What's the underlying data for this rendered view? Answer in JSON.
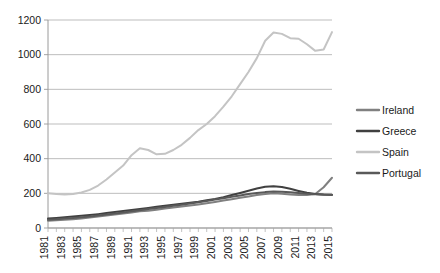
{
  "chart_data": {
    "type": "line",
    "title": "",
    "subtitle": "",
    "xlabel": "",
    "ylabel": "",
    "ylim": [
      0,
      1200
    ],
    "xlim": [
      1981,
      2015
    ],
    "yticks": [
      0,
      200,
      400,
      600,
      800,
      1000,
      1200
    ],
    "grid": true,
    "legend_position": "right",
    "x": [
      1981,
      1982,
      1983,
      1984,
      1985,
      1986,
      1987,
      1988,
      1989,
      1990,
      1991,
      1992,
      1993,
      1994,
      1995,
      1996,
      1997,
      1998,
      1999,
      2000,
      2001,
      2002,
      2003,
      2004,
      2005,
      2006,
      2007,
      2008,
      2009,
      2010,
      2011,
      2012,
      2013,
      2014,
      2015
    ],
    "xtick_labels": [
      "1981",
      "1983",
      "1985",
      "1987",
      "1989",
      "1991",
      "1993",
      "1995",
      "1997",
      "1999",
      "2001",
      "2003",
      "2005",
      "2007",
      "2009",
      "2011",
      "2013",
      "2015"
    ],
    "series": [
      {
        "name": "Ireland",
        "color": "#808080",
        "width": 2.0,
        "values": [
          42,
          44,
          47,
          50,
          55,
          60,
          66,
          72,
          78,
          84,
          90,
          96,
          100,
          105,
          112,
          118,
          124,
          130,
          136,
          143,
          150,
          158,
          166,
          174,
          182,
          190,
          196,
          200,
          198,
          193,
          190,
          190,
          196,
          235,
          290
        ]
      },
      {
        "name": "Greece",
        "color": "#404040",
        "width": 2.0,
        "values": [
          55,
          58,
          62,
          66,
          70,
          75,
          80,
          86,
          92,
          98,
          104,
          110,
          116,
          122,
          128,
          134,
          140,
          146,
          152,
          160,
          168,
          178,
          190,
          202,
          215,
          228,
          238,
          241,
          236,
          226,
          214,
          203,
          196,
          193,
          192
        ]
      },
      {
        "name": "Spain",
        "color": "#c4c4c4",
        "width": 2.0,
        "values": [
          200,
          196,
          193,
          196,
          205,
          220,
          245,
          280,
          320,
          360,
          420,
          460,
          450,
          425,
          428,
          450,
          480,
          520,
          565,
          600,
          645,
          700,
          760,
          830,
          900,
          980,
          1080,
          1128,
          1120,
          1095,
          1092,
          1060,
          1022,
          1030,
          1130
        ]
      },
      {
        "name": "Portugal",
        "color": "#595959",
        "width": 2.0,
        "values": [
          48,
          51,
          55,
          58,
          62,
          67,
          72,
          78,
          84,
          90,
          96,
          103,
          109,
          115,
          121,
          128,
          134,
          141,
          148,
          156,
          164,
          172,
          180,
          188,
          196,
          202,
          207,
          210,
          209,
          206,
          202,
          198,
          194,
          192,
          190
        ]
      }
    ]
  },
  "legend": {
    "entries": [
      {
        "label": "Ireland"
      },
      {
        "label": "Greece"
      },
      {
        "label": "Spain"
      },
      {
        "label": "Portugal"
      }
    ]
  }
}
